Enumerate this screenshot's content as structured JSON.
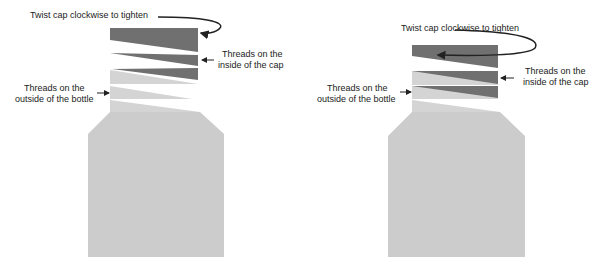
{
  "colors": {
    "cap": "#6f6f6f",
    "bottle": "#cccccc",
    "bottle_light": "#d6d6d6",
    "arrow": "#222222",
    "text": "#222222"
  },
  "left_diagram": {
    "twist_label": "Twist cap clockwise to tighten",
    "inside_label_line1": "Threads on the",
    "inside_label_line2": "inside of the cap",
    "outside_label_line1": "Threads on the",
    "outside_label_line2": "outside of the bottle"
  },
  "right_diagram": {
    "twist_label": "Twist cap clockwise to tighten",
    "inside_label_line1": "Threads on the",
    "inside_label_line2": "inside of the cap",
    "outside_label_line1": "Threads on the",
    "outside_label_line2": "outside of the bottle"
  }
}
